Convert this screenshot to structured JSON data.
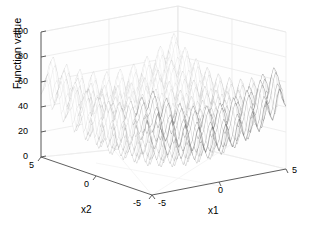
{
  "figure": {
    "background": "#ffffff",
    "mesh_color": "#8c8c8c",
    "mesh_color_front": "#555555",
    "grid_color": "#e2e2e2",
    "axis_color": "#4d4d4d"
  },
  "axes": {
    "z": {
      "title": "Function value",
      "ticks": [
        "0",
        "20",
        "40",
        "60",
        "80",
        "100"
      ],
      "range": [
        0,
        100
      ]
    },
    "x1": {
      "title": "x1",
      "ticks": [
        "-5",
        "0",
        "5"
      ],
      "range": [
        -5,
        5
      ]
    },
    "x2": {
      "title": "x2",
      "ticks": [
        "5",
        "0",
        "-5"
      ],
      "range": [
        -5,
        5
      ]
    }
  },
  "chart_data": {
    "type": "surface",
    "title": "",
    "xlabel": "x1",
    "ylabel": "x2",
    "zlabel": "Function value",
    "xlim": [
      -5,
      5
    ],
    "ylim": [
      -5,
      5
    ],
    "zlim": [
      0,
      100
    ],
    "grid": true,
    "legend": null,
    "function": "Rastrigin: f(x1,x2) = 20 + x1^2 + x2^2 - 10*cos(2*pi*x1) - 10*cos(2*pi*x2)",
    "samples": 61,
    "x": [
      -5,
      -4,
      -3,
      -2,
      -1,
      0,
      1,
      2,
      3,
      4,
      5
    ],
    "y": [
      -5,
      -4,
      -3,
      -2,
      -1,
      0,
      1,
      2,
      3,
      4,
      5
    ],
    "z": [
      [
        50,
        41,
        34,
        29,
        26,
        25,
        26,
        29,
        34,
        41,
        50
      ],
      [
        41,
        32,
        25,
        20,
        17,
        16,
        17,
        20,
        25,
        32,
        41
      ],
      [
        34,
        25,
        18,
        13,
        10,
        9,
        10,
        13,
        18,
        25,
        34
      ],
      [
        29,
        20,
        13,
        8,
        5,
        4,
        5,
        8,
        13,
        20,
        29
      ],
      [
        26,
        17,
        10,
        5,
        2,
        1,
        2,
        5,
        10,
        17,
        26
      ],
      [
        25,
        16,
        9,
        4,
        1,
        0,
        1,
        4,
        9,
        16,
        25
      ],
      [
        26,
        17,
        10,
        5,
        2,
        1,
        2,
        5,
        10,
        17,
        26
      ],
      [
        29,
        20,
        13,
        8,
        5,
        4,
        5,
        8,
        13,
        20,
        29
      ],
      [
        34,
        25,
        18,
        13,
        10,
        9,
        10,
        13,
        18,
        25,
        34
      ],
      [
        41,
        32,
        25,
        20,
        17,
        16,
        17,
        20,
        25,
        32,
        41
      ],
      [
        50,
        41,
        34,
        29,
        26,
        25,
        26,
        29,
        34,
        41,
        50
      ]
    ],
    "peak_value": 100,
    "min_value": 0,
    "ticks": {
      "z": [
        0,
        20,
        40,
        60,
        80,
        100
      ],
      "x1": [
        -5,
        0,
        5
      ],
      "x2": [
        -5,
        0,
        5
      ]
    },
    "view": {
      "azimuth": -37.5,
      "elevation": 30
    }
  }
}
